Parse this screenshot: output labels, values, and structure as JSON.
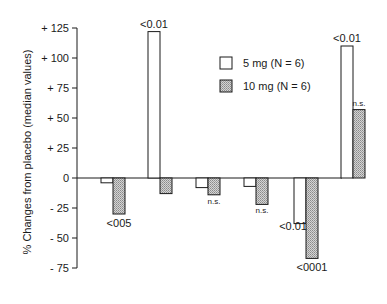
{
  "chart_data": {
    "type": "bar",
    "title": "",
    "xlabel": "",
    "ylabel": "% Changes from placebo (median values)",
    "ylim": [
      -75,
      125
    ],
    "yticks": [
      125,
      100,
      75,
      50,
      25,
      0,
      -25,
      -50,
      -75
    ],
    "ytick_labels": [
      "+ 125",
      "+ 100",
      "+  75",
      "+  50",
      "+  25",
      "0",
      "-  25",
      "-  50",
      "-  75"
    ],
    "grid": false,
    "legend_position": "upper right (inside plot)",
    "categories": [
      "1",
      "2",
      "3",
      "4",
      "5",
      "6"
    ],
    "series": [
      {
        "name": "5 mg (N = 6)",
        "fill": "white",
        "values": [
          -4,
          122,
          -8,
          -7,
          -38,
          110
        ],
        "annotations": [
          "",
          "<0.01",
          "",
          "",
          "<0.01",
          "<0.01"
        ]
      },
      {
        "name": "10 mg (N = 6)",
        "fill": "hatched",
        "values": [
          -30,
          -13,
          -14,
          -22,
          -67,
          57
        ],
        "annotations": [
          "<005",
          "",
          "n.s.",
          "n.s.",
          "<0001",
          "n.s."
        ]
      }
    ]
  },
  "legend": {
    "items": [
      {
        "label": "5 mg  (N = 6)",
        "fill": "white"
      },
      {
        "label": "10 mg  (N = 6)",
        "fill": "hatched"
      }
    ]
  },
  "colors": {
    "ink": "#1a1a1a",
    "hatch": "#b8b8b8",
    "background": "#ffffff"
  }
}
